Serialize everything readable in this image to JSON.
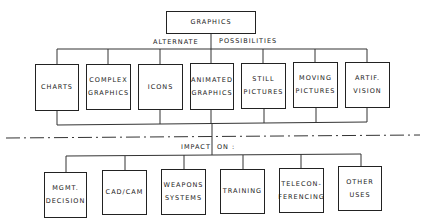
{
  "root": {
    "label": "GRAPHICS"
  },
  "caption_alternatives": {
    "left": "ALTERNATE",
    "right": "POSSIBILITIES"
  },
  "alternatives": [
    {
      "label": "CHARTS"
    },
    {
      "label": "COMPLEX\nGRAPHICS"
    },
    {
      "label": "ICONS"
    },
    {
      "label": "ANIMATED\nGRAPHICS"
    },
    {
      "label": "STILL\nPICTURES"
    },
    {
      "label": "MOVING\nPICTURES"
    },
    {
      "label": "ARTIF.\nVISION"
    }
  ],
  "caption_impact": {
    "left": "IMPACT",
    "right": "ON :"
  },
  "impacts": [
    {
      "label": "MGMT.\nDECISION"
    },
    {
      "label": "CAD/CAM"
    },
    {
      "label": "WEAPONS\nSYSTEMS"
    },
    {
      "label": "TRAINING"
    },
    {
      "label": "TELECON-\nFERENCING"
    },
    {
      "label": "OTHER\nUSES"
    }
  ]
}
